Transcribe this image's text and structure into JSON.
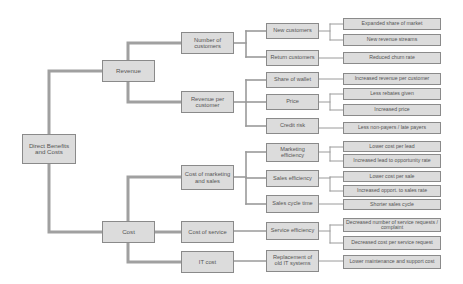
{
  "diagram": {
    "type": "tree",
    "colors": {
      "box_fill": "#dcdcdc",
      "box_border": "#8a8a8a",
      "connector": "#9a9a9a",
      "text": "#555555"
    },
    "root": {
      "label": "Direct Benefits and Costs"
    },
    "level1": [
      {
        "label": "Revenue"
      },
      {
        "label": "Cost"
      }
    ],
    "level2": [
      {
        "label": "Number of customers",
        "parent": "Revenue"
      },
      {
        "label": "Revenue per customer",
        "parent": "Revenue"
      },
      {
        "label": "Cost of marketing and sales",
        "parent": "Cost"
      },
      {
        "label": "Cost of service",
        "parent": "Cost"
      },
      {
        "label": "IT cost",
        "parent": "Cost"
      }
    ],
    "level3": [
      {
        "label": "New customers",
        "parent": "Number of customers"
      },
      {
        "label": "Return customers",
        "parent": "Number of customers"
      },
      {
        "label": "Share of wallet",
        "parent": "Revenue per customer"
      },
      {
        "label": "Price",
        "parent": "Revenue per customer"
      },
      {
        "label": "Credit risk",
        "parent": "Revenue per customer"
      },
      {
        "label": "Marketing efficiency",
        "parent": "Cost of marketing and sales"
      },
      {
        "label": "Sales efficiency",
        "parent": "Cost of marketing and sales"
      },
      {
        "label": "Sales cycle time",
        "parent": "Cost of marketing and sales"
      },
      {
        "label": "Service efficiency",
        "parent": "Cost of service"
      },
      {
        "label": "Replacement of old IT systems",
        "parent": "IT cost"
      }
    ],
    "level4": [
      {
        "label": "Expanded share of market",
        "parent": "New customers"
      },
      {
        "label": "New revenue streams",
        "parent": "New customers"
      },
      {
        "label": "Reduced churn rate",
        "parent": "Return customers"
      },
      {
        "label": "Increased revenue per customer",
        "parent": "Share of wallet"
      },
      {
        "label": "Less rebates given",
        "parent": "Price"
      },
      {
        "label": "Increased price",
        "parent": "Price"
      },
      {
        "label": "Less non-payers / late payers",
        "parent": "Credit risk"
      },
      {
        "label": "Lower cost per lead",
        "parent": "Marketing efficiency"
      },
      {
        "label": "Increased lead to opportunity rate",
        "parent": "Marketing efficiency"
      },
      {
        "label": "Lower cost per sale",
        "parent": "Sales efficiency"
      },
      {
        "label": "Increased opport. to sales rate",
        "parent": "Sales efficiency"
      },
      {
        "label": "Shorter sales cycle",
        "parent": "Sales cycle time"
      },
      {
        "label": "Decreased number of service requests / complaint",
        "parent": "Service efficiency"
      },
      {
        "label": "Decreased cost per service request",
        "parent": "Service efficiency"
      },
      {
        "label": "Lower maintenance and support cost",
        "parent": "Replacement of old IT systems"
      }
    ]
  }
}
